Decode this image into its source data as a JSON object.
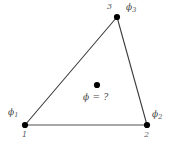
{
  "figure": {
    "background_color": "#ffffff",
    "edge_color": "#3c3c3c",
    "bottom_edge_color": "#888888",
    "node_marker_color": "#000000",
    "text_color": "#4a4a4a"
  },
  "nodes": [
    {
      "id": "node-1",
      "number": "1",
      "phi_symbol": "ϕ",
      "phi_subscript": "1",
      "x": 25,
      "y": 125,
      "number_x": 22,
      "number_y": 131,
      "phi_x": 8,
      "phi_y": 108
    },
    {
      "id": "node-2",
      "number": "2",
      "phi_symbol": "ϕ",
      "phi_subscript": "2",
      "x": 147,
      "y": 125,
      "number_x": 144,
      "number_y": 131,
      "phi_x": 152,
      "phi_y": 110
    },
    {
      "id": "node-3",
      "number": "3",
      "phi_symbol": "ϕ",
      "phi_subscript": "3",
      "x": 117,
      "y": 17,
      "number_x": 107,
      "number_y": 3,
      "phi_x": 126,
      "phi_y": 3
    }
  ],
  "interior_point": {
    "id": "interior-point",
    "x": 97,
    "y": 85,
    "label": "ϕ = ?",
    "label_x": 83,
    "label_y": 93
  },
  "edges": [
    {
      "id": "edge-1-3",
      "from": "node-1",
      "to": "node-3",
      "color": "#3c3c3c",
      "width": 1.1
    },
    {
      "id": "edge-3-2",
      "from": "node-3",
      "to": "node-2",
      "color": "#3c3c3c",
      "width": 1.1
    },
    {
      "id": "edge-1-2",
      "from": "node-1",
      "to": "node-2",
      "color": "#8a8a8a",
      "width": 1.4
    }
  ]
}
